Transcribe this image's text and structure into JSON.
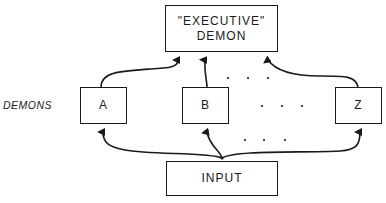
{
  "diagram": {
    "executive": {
      "line1": "\"EXECUTIVE\"",
      "line2": "DEMON"
    },
    "side_label": "DEMONS",
    "demons": [
      {
        "label": "A"
      },
      {
        "label": "B"
      },
      {
        "label": "Z"
      }
    ],
    "input": {
      "label": "INPUT"
    },
    "ellipsis": ". . .",
    "colors": {
      "stroke": "#1a1a1a",
      "background": "#ffffff"
    }
  }
}
